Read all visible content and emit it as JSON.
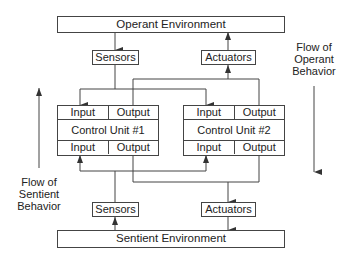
{
  "diagram": {
    "operant_environment": "Operant Environment",
    "sentient_environment": "Sentient Environment",
    "top_sensors": "Sensors",
    "top_actuators": "Actuators",
    "bottom_sensors": "Sensors",
    "bottom_actuators": "Actuators",
    "control_units": [
      {
        "title": "Control Unit #1",
        "top_input": "Input",
        "top_output": "Output",
        "bottom_input": "Input",
        "bottom_output": "Output"
      },
      {
        "title": "Control Unit #2",
        "top_input": "Input",
        "top_output": "Output",
        "bottom_input": "Input",
        "bottom_output": "Output"
      }
    ],
    "flow_operant": [
      "Flow of",
      "Operant",
      "Behavior"
    ],
    "flow_sentient": [
      "Flow of",
      "Sentient",
      "Behavior"
    ]
  },
  "colors": {
    "line": "#444444",
    "background": "#ffffff"
  }
}
